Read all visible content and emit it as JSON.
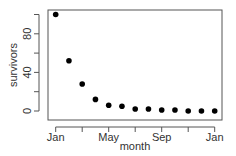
{
  "chart_data": {
    "type": "scatter",
    "title": "",
    "xlabel": "month",
    "ylabel": "survivors",
    "x_tick_labels": [
      "Jan",
      "May",
      "Sep",
      "Jan"
    ],
    "x_ticks_count": 7,
    "y_ticks": [
      0,
      20,
      40,
      60,
      80,
      100
    ],
    "y_tick_labels": [
      "0",
      "40",
      "80"
    ],
    "ylim": [
      -2,
      104
    ],
    "grid": false,
    "legend": null,
    "x": [
      "Jan",
      "Feb",
      "Mar",
      "Apr",
      "May",
      "Jun",
      "Jul",
      "Aug",
      "Sep",
      "Oct",
      "Nov",
      "Dec",
      "Jan"
    ],
    "values": [
      100,
      52,
      28,
      12,
      6,
      5,
      2,
      2,
      1,
      1,
      0,
      0,
      0
    ],
    "marker_color": "#000000"
  }
}
